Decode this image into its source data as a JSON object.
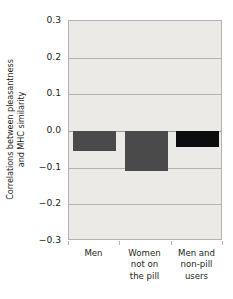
{
  "chart_data": {
    "type": "bar",
    "title": "",
    "xlabel": "",
    "ylabel": "Correlations between pleasantness and MHC similarity",
    "ylabel_lines": [
      "Correlations between pleasantness",
      "and MHC similarity"
    ],
    "categories": [
      "Men",
      "Women not on the pill",
      "Men and non-pill users"
    ],
    "category_lines": [
      [
        "Men"
      ],
      [
        "Women",
        "not on",
        "the pill"
      ],
      [
        "Men and",
        "non-pill",
        "users"
      ]
    ],
    "values": [
      -0.055,
      -0.11,
      -0.045
    ],
    "bar_colors": [
      "#4a4a4a",
      "#4a4a4a",
      "#0d0d0d"
    ],
    "ylim": [
      -0.3,
      0.3
    ],
    "ytick_values": [
      0.3,
      0.2,
      0.1,
      0.0,
      -0.1,
      -0.2,
      -0.3
    ],
    "ytick_labels": [
      "0.3",
      "0.2",
      "0.1",
      "0.0",
      "−0.1",
      "−0.2",
      "−0.3"
    ],
    "grid": true,
    "legend": "none",
    "plot_background": "#eceae6",
    "axis_color": "#b6b3ae",
    "zero_line_value": 0.0
  }
}
